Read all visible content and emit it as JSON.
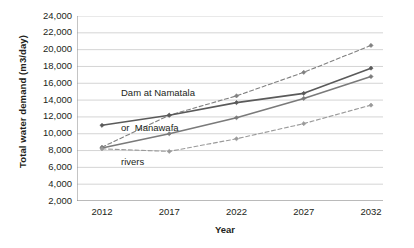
{
  "chart_data": {
    "type": "line",
    "title": "",
    "xlabel": "Year",
    "ylabel": "Total water demand (m3/day)",
    "categories": [
      "2012",
      "2017",
      "2022",
      "2027",
      "2032"
    ],
    "x": [
      2012,
      2017,
      2022,
      2027,
      2032
    ],
    "ylim": [
      2000,
      24000
    ],
    "ytick_step": 2000,
    "yticks": [
      24000,
      22000,
      20000,
      18000,
      16000,
      14000,
      12000,
      10000,
      8000,
      6000,
      4000,
      2000
    ],
    "ytick_labels": [
      "24,000",
      "22,000",
      "20,000",
      "18,000",
      "16,000",
      "14,000",
      "12,000",
      "10,000",
      "8,000",
      "6,000",
      "4,000",
      "2,000"
    ],
    "grid": "horizontal",
    "legend": "none",
    "series": [
      {
        "name": "upper-dashed",
        "style": "dashed",
        "marker": "diamond",
        "color": "#808080",
        "values": [
          8400,
          12200,
          14500,
          17300,
          20500
        ]
      },
      {
        "name": "upper-solid",
        "style": "solid",
        "marker": "diamond",
        "color": "#5a5a5a",
        "values": [
          11000,
          12200,
          13700,
          14800,
          17800
        ]
      },
      {
        "name": "lower-solid",
        "style": "solid",
        "marker": "diamond",
        "color": "#7a7a7a",
        "values": [
          8300,
          10000,
          11900,
          14200,
          16800
        ]
      },
      {
        "name": "lower-dashed",
        "style": "dashed",
        "marker": "diamond",
        "color": "#9a9a9a",
        "values": [
          8200,
          7900,
          9400,
          11200,
          13400
        ]
      }
    ],
    "annotations": [
      {
        "name": "dam-label",
        "lines": [
          "Dam at Namatala",
          "or  Manawafa",
          "rivers"
        ]
      }
    ]
  },
  "axis": {
    "y_title": "Total water demand (m3/day)",
    "x_title": "Year"
  },
  "annotation": {
    "line1": "Dam at Namatala",
    "line2": "or  Manawafa",
    "line3": "rivers"
  },
  "colors": {
    "grid": "#c9c9c9",
    "axis": "#8a8a8a",
    "text": "#231f20",
    "series_upper_dashed": "#808080",
    "series_upper_solid": "#5a5a5a",
    "series_lower_solid": "#7a7a7a",
    "series_lower_dashed": "#9a9a9a"
  }
}
